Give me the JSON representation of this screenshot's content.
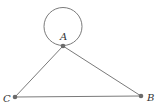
{
  "diagram": {
    "type": "graph",
    "colors": {
      "edge": "#7a7a7a",
      "node": "#6b6b6b",
      "label": "#333333"
    },
    "nodes": [
      {
        "id": "A",
        "label": "A",
        "x": 63,
        "y": 46,
        "label_x": 60,
        "label_y": 40
      },
      {
        "id": "B",
        "label": "B",
        "x": 141,
        "y": 96,
        "label_x": 147,
        "label_y": 101
      },
      {
        "id": "C",
        "label": "C",
        "x": 15,
        "y": 97,
        "label_x": 3,
        "label_y": 102
      }
    ],
    "edges": [
      {
        "from": "A",
        "to": "B"
      },
      {
        "from": "A",
        "to": "C"
      },
      {
        "from": "C",
        "to": "B"
      },
      {
        "from": "A",
        "to": "A",
        "kind": "self-loop"
      }
    ]
  }
}
